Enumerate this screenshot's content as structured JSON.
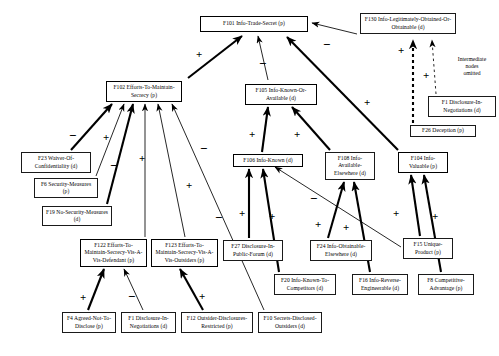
{
  "figure": {
    "type": "influence-diagram",
    "note": {
      "id": "intermediate-note",
      "lines": [
        "Intermediate",
        "nodes",
        "omitted"
      ],
      "x": 447,
      "y": 56,
      "w": 50
    },
    "nodes": [
      {
        "id": "F101",
        "label": "F101 Info-Trade-Secret (p)",
        "x": 200,
        "y": 16,
        "w": 108,
        "h": 16,
        "thick": true
      },
      {
        "id": "F130",
        "label": "F130 Info-Legitimately-Obtained-Or-Obtainable (d)",
        "x": 360,
        "y": 13,
        "w": 96,
        "h": 21,
        "thick": false
      },
      {
        "id": "F102",
        "label": "F102 Efforts-To-Maintain-Secrecy (p)",
        "x": 106,
        "y": 81,
        "w": 76,
        "h": 21,
        "thick": true
      },
      {
        "id": "F105",
        "label": "F105 Info-Known-Or-Available (d)",
        "x": 245,
        "y": 84,
        "w": 72,
        "h": 21,
        "thick": true
      },
      {
        "id": "F1b",
        "label": "F1 Disclosure-In-Negotiations (d)",
        "x": 428,
        "y": 96,
        "w": 68,
        "h": 21,
        "thick": false
      },
      {
        "id": "F26",
        "label": "F26 Deception (p)",
        "x": 410,
        "y": 125,
        "w": 66,
        "h": 12,
        "thick": false
      },
      {
        "id": "F23",
        "label": "F23 Waiver-Of-Confidentiality (d)",
        "x": 21,
        "y": 152,
        "w": 70,
        "h": 21,
        "thick": false
      },
      {
        "id": "F6",
        "label": "F6 Security-Measures (p)",
        "x": 34,
        "y": 178,
        "w": 64,
        "h": 20,
        "thick": false
      },
      {
        "id": "F19",
        "label": "F19 No-Security-Measures (d)",
        "x": 42,
        "y": 206,
        "w": 70,
        "h": 20,
        "thick": false
      },
      {
        "id": "F106",
        "label": "F106 Info-Known (d)",
        "x": 233,
        "y": 154,
        "w": 70,
        "h": 13,
        "thick": true
      },
      {
        "id": "F108",
        "label": "F108 Info-Available-Elsewhere (d)",
        "x": 325,
        "y": 152,
        "w": 50,
        "h": 28,
        "thick": false
      },
      {
        "id": "F104",
        "label": "F104 Info-Valuable (p)",
        "x": 398,
        "y": 152,
        "w": 50,
        "h": 21,
        "thick": true
      },
      {
        "id": "F122",
        "label": "F122 Efforts-To-Maintain-Secrecy-Vis-A-Vis-Defendant (p)",
        "x": 80,
        "y": 239,
        "w": 67,
        "h": 28,
        "thick": true
      },
      {
        "id": "F123",
        "label": "F123 Efforts-To-Maintain-Secrecy-Vis-A-Vis-Outsiders (p)",
        "x": 151,
        "y": 239,
        "w": 67,
        "h": 28,
        "thick": true
      },
      {
        "id": "F27",
        "label": "F27 Disclosure-In-Public-Forum (d)",
        "x": 223,
        "y": 240,
        "w": 60,
        "h": 21,
        "thick": false
      },
      {
        "id": "F24",
        "label": "F24 Info-Obtainable-Elsewhere (d)",
        "x": 310,
        "y": 240,
        "w": 62,
        "h": 21,
        "thick": false
      },
      {
        "id": "F15",
        "label": "F15 Unique-Product (p)",
        "x": 403,
        "y": 238,
        "w": 50,
        "h": 21,
        "thick": false
      },
      {
        "id": "F20",
        "label": "F20 Info-Known-To-Competitors (d)",
        "x": 274,
        "y": 274,
        "w": 62,
        "h": 21,
        "thick": false
      },
      {
        "id": "F16",
        "label": "F16 Info-Reverse-Engineerable (d)",
        "x": 352,
        "y": 274,
        "w": 56,
        "h": 21,
        "thick": false
      },
      {
        "id": "F8",
        "label": "F8 Competitive-Advantage (p)",
        "x": 418,
        "y": 274,
        "w": 56,
        "h": 21,
        "thick": false
      },
      {
        "id": "F4",
        "label": "F4 Agreed-Not-To-Disclose (p)",
        "x": 62,
        "y": 312,
        "w": 54,
        "h": 21,
        "thick": false
      },
      {
        "id": "F1a",
        "label": "F1 Disclosure-In-Negotiations (d)",
        "x": 121,
        "y": 312,
        "w": 55,
        "h": 21,
        "thick": false
      },
      {
        "id": "F12",
        "label": "F12 Outsider-Disclosures-Restricted (p)",
        "x": 181,
        "y": 312,
        "w": 72,
        "h": 21,
        "thick": false
      },
      {
        "id": "F10",
        "label": "F10 Secrets-Disclosed-Outsiders (d)",
        "x": 258,
        "y": 312,
        "w": 64,
        "h": 21,
        "thick": false
      }
    ],
    "edges": [
      {
        "id": "F102-F101",
        "from": "F102",
        "to": "F101",
        "x1": 188,
        "y1": 78,
        "x2": 242,
        "y2": 36,
        "weight": "thick",
        "dashed": false
      },
      {
        "id": "F105-F101",
        "from": "F105",
        "to": "F101",
        "x1": 268,
        "y1": 80,
        "x2": 258,
        "y2": 36,
        "weight": "thin",
        "dashed": false
      },
      {
        "id": "F104-F101",
        "from": "F104",
        "to": "F101",
        "x1": 398,
        "y1": 150,
        "x2": 287,
        "y2": 37,
        "weight": "thick",
        "dashed": false
      },
      {
        "id": "F130-F101",
        "from": "F130",
        "to": "F101",
        "x1": 357,
        "y1": 34,
        "x2": 312,
        "y2": 23,
        "weight": "thin",
        "dashed": false
      },
      {
        "id": "F26-F130",
        "from": "F26",
        "to": "F130",
        "x1": 413,
        "y1": 123,
        "x2": 413,
        "y2": 40,
        "weight": "thick",
        "dashed": true
      },
      {
        "id": "F1b-F130",
        "from": "F1b",
        "to": "F130",
        "x1": 436,
        "y1": 94,
        "x2": 432,
        "y2": 40,
        "weight": "thin",
        "dashed": true
      },
      {
        "id": "F23-F102",
        "from": "F23",
        "to": "F102",
        "x1": 71,
        "y1": 150,
        "x2": 112,
        "y2": 104,
        "weight": "thick",
        "dashed": false
      },
      {
        "id": "F6-F102",
        "from": "F6",
        "to": "F102",
        "x1": 96,
        "y1": 176,
        "x2": 124,
        "y2": 104,
        "weight": "thin",
        "dashed": false
      },
      {
        "id": "F19-F102",
        "from": "F19",
        "to": "F102",
        "x1": 107,
        "y1": 204,
        "x2": 133,
        "y2": 104,
        "weight": "thick",
        "dashed": false
      },
      {
        "id": "F122-F102",
        "from": "F122",
        "to": "F102",
        "x1": 145,
        "y1": 237,
        "x2": 145,
        "y2": 104,
        "weight": "thin",
        "dashed": false
      },
      {
        "id": "F123-F102",
        "from": "F123",
        "to": "F102",
        "x1": 185,
        "y1": 237,
        "x2": 158,
        "y2": 104,
        "weight": "thin",
        "dashed": false
      },
      {
        "id": "F10-F102",
        "from": "F10",
        "to": "F102",
        "x1": 264,
        "y1": 310,
        "x2": 172,
        "y2": 104,
        "weight": "thin",
        "dashed": false
      },
      {
        "id": "F4-F122",
        "from": "F4",
        "to": "F122",
        "x1": 88,
        "y1": 310,
        "x2": 104,
        "y2": 269,
        "weight": "thick",
        "dashed": false
      },
      {
        "id": "F1a-F122",
        "from": "F1a",
        "to": "F122",
        "x1": 143,
        "y1": 310,
        "x2": 124,
        "y2": 269,
        "weight": "thin",
        "dashed": false
      },
      {
        "id": "F12-F123",
        "from": "F12",
        "to": "F123",
        "x1": 203,
        "y1": 310,
        "x2": 180,
        "y2": 269,
        "weight": "thick",
        "dashed": false
      },
      {
        "id": "F106-F105",
        "from": "F106",
        "to": "F105",
        "x1": 262,
        "y1": 152,
        "x2": 268,
        "y2": 107,
        "weight": "thick",
        "dashed": false
      },
      {
        "id": "F108-F105",
        "from": "F108",
        "to": "F105",
        "x1": 330,
        "y1": 150,
        "x2": 292,
        "y2": 107,
        "weight": "thick",
        "dashed": false
      },
      {
        "id": "F27-F106",
        "from": "F27",
        "to": "F106",
        "x1": 249,
        "y1": 238,
        "x2": 249,
        "y2": 169,
        "weight": "thick",
        "dashed": false
      },
      {
        "id": "F20-F106",
        "from": "F20",
        "to": "F106",
        "x1": 279,
        "y1": 272,
        "x2": 263,
        "y2": 169,
        "weight": "thick",
        "dashed": false
      },
      {
        "id": "F15-F106",
        "from": "F15",
        "to": "F106",
        "x1": 401,
        "y1": 247,
        "x2": 275,
        "y2": 167,
        "weight": "thin",
        "dashed": false
      },
      {
        "id": "F24-F108",
        "from": "F24",
        "to": "F108",
        "x1": 328,
        "y1": 238,
        "x2": 344,
        "y2": 182,
        "weight": "thick",
        "dashed": false
      },
      {
        "id": "F16-F108",
        "from": "F16",
        "to": "F108",
        "x1": 370,
        "y1": 272,
        "x2": 354,
        "y2": 182,
        "weight": "thick",
        "dashed": false
      },
      {
        "id": "F15-F104",
        "from": "F15",
        "to": "F104",
        "x1": 420,
        "y1": 236,
        "x2": 411,
        "y2": 175,
        "weight": "thick",
        "dashed": false
      },
      {
        "id": "F8-F104",
        "from": "F8",
        "to": "F104",
        "x1": 441,
        "y1": 272,
        "x2": 424,
        "y2": 175,
        "weight": "thick",
        "dashed": false
      }
    ],
    "signs": [
      {
        "id": "sign-F102-F101",
        "value": "+",
        "x": 196,
        "y": 49
      },
      {
        "id": "sign-F105-F101",
        "value": "−",
        "x": 259,
        "y": 58
      },
      {
        "id": "sign-F130-F101",
        "value": "−",
        "x": 323,
        "y": 39
      },
      {
        "id": "sign-F26-F130",
        "value": "+",
        "x": 398,
        "y": 45
      },
      {
        "id": "sign-F1b-F130",
        "value": "+",
        "x": 423,
        "y": 70
      },
      {
        "id": "sign-F104-F101",
        "value": "+",
        "x": 364,
        "y": 97
      },
      {
        "id": "sign-F23-F102",
        "value": "−",
        "x": 69,
        "y": 130
      },
      {
        "id": "sign-F6-F102",
        "value": "+",
        "x": 103,
        "y": 132
      },
      {
        "id": "sign-F19-F102",
        "value": "−",
        "x": 110,
        "y": 160
      },
      {
        "id": "sign-F122-F102",
        "value": "+",
        "x": 139,
        "y": 153
      },
      {
        "id": "sign-F123-F102",
        "value": "−",
        "x": 200,
        "y": 143
      },
      {
        "id": "sign-F10-F102",
        "value": "+",
        "x": 186,
        "y": 180
      },
      {
        "id": "sign-F10-F102b",
        "value": "−",
        "x": 215,
        "y": 212
      },
      {
        "id": "sign-F4-F122",
        "value": "+",
        "x": 80,
        "y": 292
      },
      {
        "id": "sign-F1a-F122",
        "value": "−",
        "x": 128,
        "y": 291
      },
      {
        "id": "sign-F12-F123",
        "value": "+",
        "x": 199,
        "y": 291
      },
      {
        "id": "sign-F106-F105",
        "value": "+",
        "x": 249,
        "y": 129
      },
      {
        "id": "sign-F108-F105",
        "value": "+",
        "x": 294,
        "y": 129
      },
      {
        "id": "sign-F15-F106",
        "value": "−",
        "x": 310,
        "y": 193
      },
      {
        "id": "sign-F27-F106",
        "value": "+",
        "x": 239,
        "y": 208
      },
      {
        "id": "sign-F20-F106",
        "value": "+",
        "x": 269,
        "y": 211
      },
      {
        "id": "sign-F24-F108",
        "value": "+",
        "x": 315,
        "y": 219
      },
      {
        "id": "sign-F16-F108",
        "value": "+",
        "x": 343,
        "y": 222
      },
      {
        "id": "sign-F15-F104",
        "value": "+",
        "x": 393,
        "y": 208
      },
      {
        "id": "sign-F8-F104",
        "value": "+",
        "x": 432,
        "y": 211
      }
    ]
  }
}
